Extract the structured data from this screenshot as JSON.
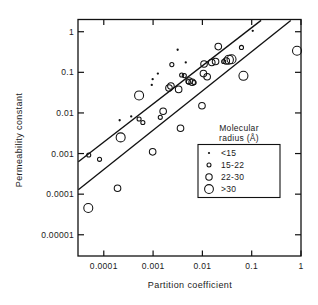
{
  "chart_data": {
    "type": "scatter",
    "title": "",
    "xlabel": "Partition coefficient",
    "ylabel": "Permeability constant",
    "xscale": "log",
    "yscale": "log",
    "xlim": [
      3e-05,
      1.0
    ],
    "ylim": [
      3e-06,
      2.0
    ],
    "grid": false,
    "xticks": [
      0.0001,
      0.001,
      0.01,
      0.1,
      1
    ],
    "xticklabels": [
      "0.0001",
      "0.001",
      "0.01",
      "0.1",
      "1"
    ],
    "yticks": [
      1,
      0.1,
      0.01,
      0.001,
      0.0001,
      1e-05
    ],
    "yticklabels": [
      "1",
      "0.1",
      "0.01",
      "0.001",
      "0.0001",
      "0.00001"
    ],
    "legend": {
      "position": "inside-lower-right",
      "title_line1": "Molecular",
      "title_line2": "radius  (Å)",
      "entries": [
        {
          "label": "<15",
          "marker": "dot",
          "radius_px": 1.1
        },
        {
          "label": "15-22",
          "marker": "small-circle",
          "radius_px": 2.0
        },
        {
          "label": "22-30",
          "marker": "medium-circle",
          "radius_px": 3.2
        },
        {
          "label": ">30",
          "marker": "large-circle",
          "radius_px": 4.4
        }
      ]
    },
    "series": [
      {
        "name": "<15",
        "marker": "dot",
        "points": [
          {
            "x": 0.105,
            "y": 1.05
          },
          {
            "x": 0.0046,
            "y": 0.175
          },
          {
            "x": 0.00125,
            "y": 0.093
          },
          {
            "x": 0.00098,
            "y": 0.068
          },
          {
            "x": 0.00094,
            "y": 0.049
          },
          {
            "x": 0.00036,
            "y": 0.0082
          },
          {
            "x": 0.00021,
            "y": 0.0066
          },
          {
            "x": 0.00315,
            "y": 0.36
          }
        ]
      },
      {
        "name": "15-22",
        "marker": "small-circle",
        "points": [
          {
            "x": 4.95e-05,
            "y": 0.00092
          },
          {
            "x": 8.2e-05,
            "y": 0.00072
          },
          {
            "x": 0.00052,
            "y": 0.0071
          },
          {
            "x": 0.00062,
            "y": 0.0058
          },
          {
            "x": 0.0014,
            "y": 0.0078
          },
          {
            "x": 0.0038,
            "y": 0.086
          },
          {
            "x": 0.0043,
            "y": 0.083
          },
          {
            "x": 0.0052,
            "y": 0.059
          },
          {
            "x": 0.027,
            "y": 0.185
          },
          {
            "x": 0.0024,
            "y": 0.155
          },
          {
            "x": 0.0068,
            "y": 0.056
          },
          {
            "x": 0.062,
            "y": 0.41
          }
        ]
      },
      {
        "name": "22-30",
        "marker": "medium-circle",
        "points": [
          {
            "x": 0.00098,
            "y": 0.0011
          },
          {
            "x": 0.0016,
            "y": 0.011
          },
          {
            "x": 0.0021,
            "y": 0.041
          },
          {
            "x": 0.0023,
            "y": 0.046
          },
          {
            "x": 0.0033,
            "y": 0.038
          },
          {
            "x": 0.0054,
            "y": 0.061
          },
          {
            "x": 0.0062,
            "y": 0.057
          },
          {
            "x": 0.0105,
            "y": 0.093
          },
          {
            "x": 0.0108,
            "y": 0.16
          },
          {
            "x": 0.0125,
            "y": 0.078
          },
          {
            "x": 0.0185,
            "y": 0.185
          },
          {
            "x": 0.021,
            "y": 0.43
          },
          {
            "x": 0.0155,
            "y": 0.175
          },
          {
            "x": 0.0305,
            "y": 0.19
          },
          {
            "x": 0.0098,
            "y": 0.015
          },
          {
            "x": 0.0036,
            "y": 0.0042
          },
          {
            "x": 0.00019,
            "y": 0.00014
          }
        ]
      },
      {
        "name": ">30",
        "marker": "large-circle",
        "points": [
          {
            "x": 4.85e-05,
            "y": 4.55e-05
          },
          {
            "x": 0.00022,
            "y": 0.0025
          },
          {
            "x": 0.00052,
            "y": 0.027
          },
          {
            "x": 0.0345,
            "y": 0.205
          },
          {
            "x": 0.039,
            "y": 0.21
          },
          {
            "x": 0.068,
            "y": 0.082
          },
          {
            "x": 0.83,
            "y": 0.34
          }
        ]
      }
    ],
    "trendlines": [
      {
        "name": "upper-line",
        "x1": 3.05e-05,
        "y1": 0.00063,
        "x2": 0.155,
        "y2": 1.9
      },
      {
        "name": "lower-line",
        "x1": 3.05e-05,
        "y1": 0.000128,
        "x2": 0.62,
        "y2": 1.9
      }
    ]
  }
}
